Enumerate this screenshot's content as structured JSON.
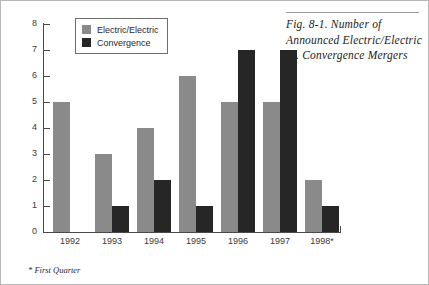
{
  "caption": {
    "text": "Fig. 8-1. Number of Announced Electric/Electric vs. Convergence Mergers"
  },
  "footnote": {
    "text": "* First Quarter"
  },
  "colors": {
    "series_a": "#8a8a8a",
    "series_b": "#262626",
    "axis": "#4a4a4a",
    "page_border": "#b8b8b8"
  },
  "chart_data": {
    "type": "bar",
    "title": "Fig. 8-1. Number of Announced Electric/Electric vs. Convergence Mergers",
    "xlabel": "",
    "ylabel": "",
    "categories": [
      "1992",
      "1993",
      "1994",
      "1995",
      "1996",
      "1997",
      "1998*"
    ],
    "series": [
      {
        "name": "Electric/Electric",
        "values": [
          5,
          3,
          4,
          6,
          5,
          5,
          2
        ]
      },
      {
        "name": "Convergence",
        "values": [
          0,
          1,
          2,
          1,
          7,
          7,
          1
        ]
      }
    ],
    "ylim": [
      0,
      8
    ],
    "yticks": [
      0,
      1,
      2,
      3,
      4,
      5,
      6,
      7,
      8
    ],
    "ytick_labels": [
      "0",
      "1",
      "2",
      "3",
      "4",
      "5",
      "6",
      "7",
      "8"
    ],
    "grid": false,
    "legend_position": "top-left",
    "legend": [
      "Electric/Electric",
      "Convergence"
    ]
  }
}
